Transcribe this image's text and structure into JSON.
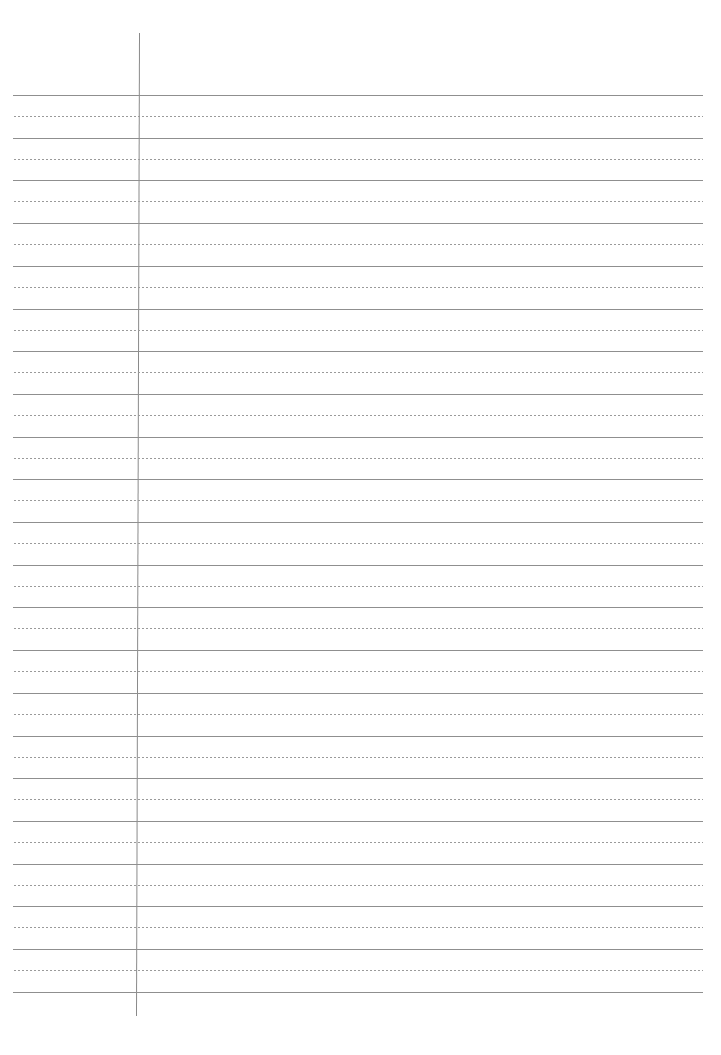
{
  "page": {
    "type": "ruled notebook paper",
    "background_color": "#ffffff",
    "solid_line_color": "#8f8f8f",
    "dotted_line_color": "#9a9a9a",
    "margin_line_color": "#8a8a8a"
  },
  "layout": {
    "rule_left": 13,
    "rule_right": 703,
    "first_solid_y": 95,
    "line_spacing": 42.7,
    "solid_line_count": 22,
    "margin_line": {
      "x_top": 139,
      "x_bottom": 136,
      "y_top": 33,
      "y_bottom": 1016
    }
  }
}
